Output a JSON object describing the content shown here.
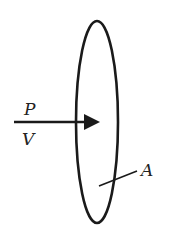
{
  "diagram": {
    "labels": {
      "power": "P",
      "velocity": "V",
      "area": "A"
    },
    "colors": {
      "stroke": "#1a1a1a",
      "background": "#ffffff"
    }
  }
}
